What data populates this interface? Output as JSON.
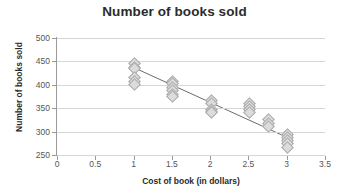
{
  "chart_data": {
    "type": "scatter",
    "title": "Number of books sold",
    "xlabel": "Cost of book (in dollars)",
    "ylabel": "Number of books sold",
    "xlim": [
      0,
      3.5
    ],
    "ylim": [
      250,
      500
    ],
    "xticks": [
      0,
      0.5,
      1,
      1.5,
      2,
      2.5,
      3,
      3.5
    ],
    "xtick_labels": [
      "0",
      "0.5",
      "1",
      "1.5",
      "2",
      "2.5",
      "3",
      "3.5"
    ],
    "yticks": [
      250,
      300,
      350,
      400,
      450,
      500
    ],
    "ytick_labels": [
      "250",
      "300",
      "350",
      "400",
      "450",
      "500"
    ],
    "grid": "horizontal",
    "legend": "none",
    "marker": "diamond",
    "marker_color": "#dcdcdc",
    "marker_edge_color": "#a9a9a9",
    "trendline_color": "#6b6b6b",
    "gridline_color": "#d6d6d6",
    "axis_color": "#9a9a9a",
    "points": [
      {
        "x": 1,
        "y": 448
      },
      {
        "x": 1,
        "y": 440
      },
      {
        "x": 1,
        "y": 436
      },
      {
        "x": 1,
        "y": 418
      },
      {
        "x": 1,
        "y": 410
      },
      {
        "x": 1,
        "y": 402
      },
      {
        "x": 1.5,
        "y": 410
      },
      {
        "x": 1.5,
        "y": 404
      },
      {
        "x": 1.5,
        "y": 396
      },
      {
        "x": 1.5,
        "y": 390
      },
      {
        "x": 1.5,
        "y": 382
      },
      {
        "x": 1.5,
        "y": 377
      },
      {
        "x": 2,
        "y": 368
      },
      {
        "x": 2,
        "y": 362
      },
      {
        "x": 2,
        "y": 350
      },
      {
        "x": 2,
        "y": 345
      },
      {
        "x": 2,
        "y": 342
      },
      {
        "x": 2.5,
        "y": 363
      },
      {
        "x": 2.5,
        "y": 355
      },
      {
        "x": 2.5,
        "y": 350
      },
      {
        "x": 2.5,
        "y": 344
      },
      {
        "x": 2.75,
        "y": 327
      },
      {
        "x": 2.75,
        "y": 320
      },
      {
        "x": 2.75,
        "y": 314
      },
      {
        "x": 3,
        "y": 297
      },
      {
        "x": 3,
        "y": 290
      },
      {
        "x": 3,
        "y": 284
      },
      {
        "x": 3,
        "y": 276
      },
      {
        "x": 3,
        "y": 268
      }
    ],
    "trendline": {
      "x_start": 1,
      "y_start": 437,
      "x_end": 3,
      "y_end": 288
    }
  }
}
